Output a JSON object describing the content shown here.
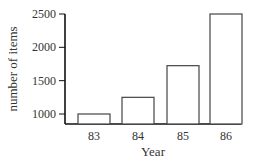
{
  "chart_data": {
    "type": "bar",
    "title": "",
    "xlabel": "Year",
    "ylabel": "number of items",
    "categories": [
      "83",
      "84",
      "85",
      "86"
    ],
    "values": [
      1000,
      1250,
      1725,
      2500
    ],
    "ylim": [
      850,
      2500
    ],
    "yticks": [
      1000,
      1500,
      2000,
      2500
    ],
    "grid": false,
    "legend": null,
    "bar_fill": "#ffffff",
    "bar_stroke": "#444444"
  }
}
